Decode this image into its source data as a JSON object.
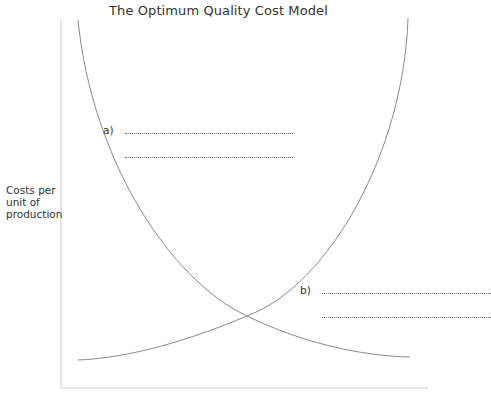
{
  "diagram": {
    "title": "The Optimum Quality Cost Model",
    "y_axis_label": [
      "Costs per",
      "unit of",
      "production"
    ],
    "x_axis_label": "",
    "curves": [
      {
        "name": "falling-cost-curve",
        "description": "Decreasing curve from top-left to bottom-right"
      },
      {
        "name": "rising-cost-curve",
        "description": "Increasing curve from bottom-left to top-right"
      }
    ],
    "annotations": [
      {
        "label": "a)",
        "blank_lines": 2
      },
      {
        "label": "b)",
        "blank_lines": 2
      }
    ],
    "colors": {
      "line": "#8a8a8a",
      "axis": "#c8c8c8",
      "text": "#333333"
    }
  }
}
